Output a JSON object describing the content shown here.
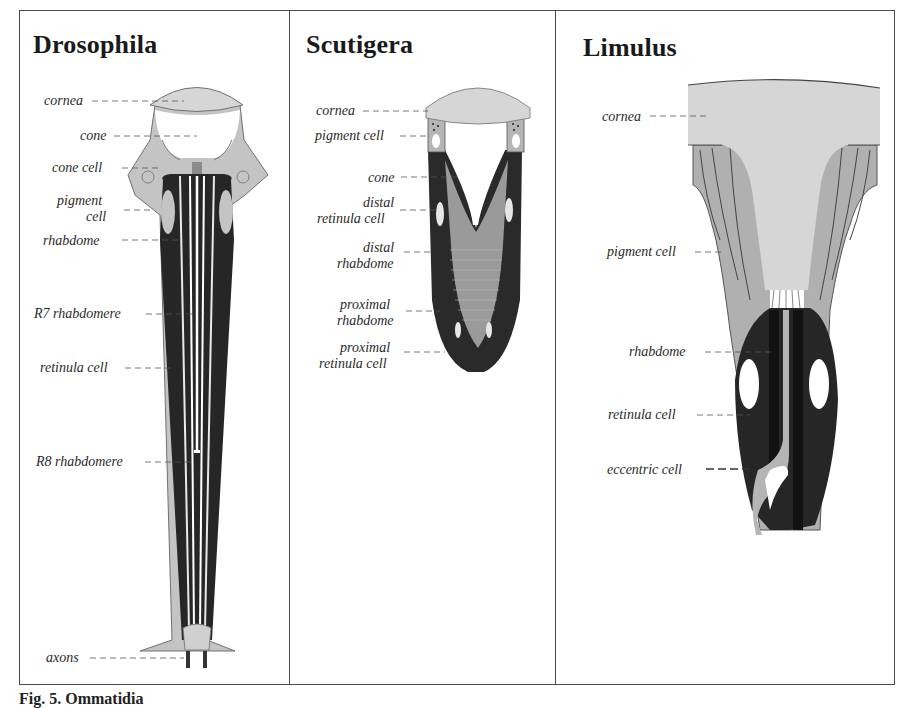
{
  "figure": {
    "caption": "Fig. 5. Ommatidia",
    "colors": {
      "frame": "#4a4a4a",
      "light_gray": "#c4c4c4",
      "cornea_gray": "#d6d6d6",
      "mid_gray": "#b0b0b0",
      "dark": "#262626",
      "white": "#ffffff"
    }
  },
  "panels": [
    {
      "title": "Drosophila",
      "labels": [
        {
          "text": "cornea"
        },
        {
          "text": "cone"
        },
        {
          "text": "cone cell"
        },
        {
          "text": "pigment"
        },
        {
          "text": "cell"
        },
        {
          "text": "rhabdome"
        },
        {
          "text": "R7 rhabdomere"
        },
        {
          "text": "retinula cell"
        },
        {
          "text": "R8 rhabdomere"
        },
        {
          "text": "axons"
        }
      ]
    },
    {
      "title": "Scutigera",
      "labels": [
        {
          "text": "cornea"
        },
        {
          "text": "pigment cell"
        },
        {
          "text": "cone"
        },
        {
          "text": "distal"
        },
        {
          "text": "retinula cell"
        },
        {
          "text": "distal"
        },
        {
          "text": "rhabdome"
        },
        {
          "text": "proximal"
        },
        {
          "text": "rhabdome"
        },
        {
          "text": "proximal"
        },
        {
          "text": "retinula cell"
        }
      ]
    },
    {
      "title": "Limulus",
      "labels": [
        {
          "text": "cornea"
        },
        {
          "text": "pigment cell"
        },
        {
          "text": "rhabdome"
        },
        {
          "text": "retinula cell"
        },
        {
          "text": "eccentric cell"
        }
      ]
    }
  ]
}
